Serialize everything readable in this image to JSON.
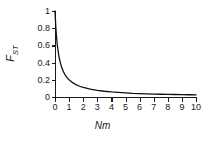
{
  "chart_data": {
    "type": "line",
    "title": "",
    "subtitle": "",
    "xlabel": "Nm",
    "ylabel": "FST",
    "ylabel_main": "F",
    "ylabel_sub": "ST",
    "xlim": [
      0,
      10
    ],
    "ylim": [
      0,
      1
    ],
    "grid": false,
    "legend": "none",
    "xticks": [
      "0",
      "1",
      "2",
      "3",
      "4",
      "5",
      "6",
      "7",
      "8",
      "9",
      "10"
    ],
    "xtick_values": [
      0,
      1,
      2,
      3,
      4,
      5,
      6,
      7,
      8,
      9,
      10
    ],
    "yticks": [
      "0",
      "0.2",
      "0.4",
      "0.6",
      "0.8",
      "1"
    ],
    "ytick_values": [
      0,
      0.2,
      0.4,
      0.6,
      0.8,
      1
    ],
    "series": [
      {
        "name": "FST = 1/(1+4Nm)",
        "color": "#111111",
        "x": [
          0,
          0.05,
          0.1,
          0.15,
          0.2,
          0.25,
          0.3,
          0.4,
          0.5,
          0.6,
          0.7,
          0.8,
          0.9,
          1,
          1.25,
          1.5,
          1.75,
          2,
          2.5,
          3,
          3.5,
          4,
          4.5,
          5,
          5.5,
          6,
          6.5,
          7,
          7.5,
          8,
          8.5,
          9,
          9.5,
          10
        ],
        "y": [
          1,
          0.833,
          0.714,
          0.625,
          0.556,
          0.5,
          0.455,
          0.385,
          0.333,
          0.294,
          0.263,
          0.238,
          0.217,
          0.2,
          0.167,
          0.143,
          0.125,
          0.111,
          0.091,
          0.077,
          0.067,
          0.059,
          0.053,
          0.048,
          0.043,
          0.04,
          0.037,
          0.034,
          0.032,
          0.03,
          0.029,
          0.027,
          0.026,
          0.024
        ]
      }
    ]
  },
  "style": {
    "axis_color": "#1a1a1a",
    "curve_color": "#111111",
    "background": "#ffffff"
  }
}
